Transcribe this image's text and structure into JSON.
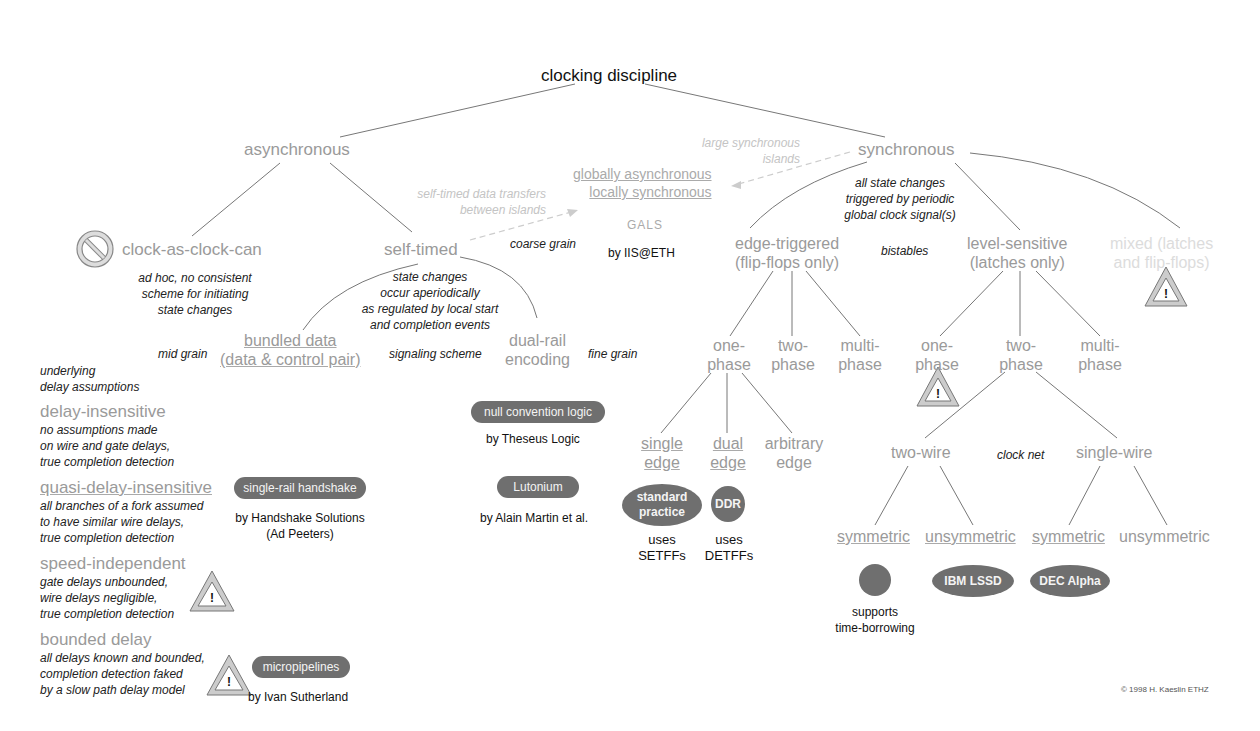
{
  "title": "clocking discipline",
  "copyright": "© 1998 H. Kaeslin ETHZ",
  "level1": {
    "asynchronous": "asynchronous",
    "synchronous": "synchronous"
  },
  "async": {
    "clock_as_clock_can": "clock-as-clock-can",
    "clock_as_clock_can_note": [
      "ad hoc, no consistent",
      "scheme for initiating",
      "state changes"
    ],
    "self_timed": "self-timed",
    "self_timed_note": [
      "state changes",
      "occur aperiodically",
      "as regulated by local start",
      "and completion events"
    ],
    "bundled_data": [
      "bundled data",
      "(data & control pair)"
    ],
    "dual_rail": [
      "dual-rail",
      "encoding"
    ],
    "mid_grain": "mid grain",
    "signaling_scheme": "signaling scheme",
    "fine_grain": "fine grain",
    "coarse_grain": "coarse grain",
    "self_timed_transfers": [
      "self-timed data transfers",
      "between islands"
    ]
  },
  "gals": {
    "line1": "globally asynchronous",
    "line2": "locally synchronous",
    "abbr": "GALS",
    "by": "by IIS@ETH",
    "large_islands": [
      "large synchronous",
      "islands"
    ]
  },
  "delay_models": {
    "header": [
      "underlying",
      "delay assumptions"
    ],
    "items": [
      {
        "name": "delay-insensitive",
        "desc": [
          "no assumptions made",
          "on wire and gate delays,",
          "true completion detection"
        ]
      },
      {
        "name": "quasi-delay-insensitive",
        "desc": [
          "all branches of a fork assumed",
          "to have similar wire delays,",
          "true completion detection"
        ]
      },
      {
        "name": "speed-independent",
        "desc": [
          "gate delays unbounded,",
          "wire delays negligible,",
          "true completion detection"
        ]
      },
      {
        "name": "bounded delay",
        "desc": [
          "all delays known and bounded,",
          "completion detection faked",
          "by a slow path delay model"
        ]
      }
    ]
  },
  "examples": {
    "ncl": {
      "label": "null convention logic",
      "by": "by Theseus Logic"
    },
    "lutonium": {
      "label": "Lutonium",
      "by": "by Alain Martin et al."
    },
    "handshake": {
      "label": "single-rail handshake",
      "by": [
        "by Handshake Solutions",
        "(Ad Peeters)"
      ]
    },
    "micropipelines": {
      "label": "micropipelines",
      "by": "by Ivan Sutherland"
    }
  },
  "sync": {
    "note": [
      "all state changes",
      "triggered by periodic",
      "global clock signal(s)"
    ],
    "bistables": "bistables",
    "edge_triggered": [
      "edge-triggered",
      "(flip-flops only)"
    ],
    "level_sensitive": [
      "level-sensitive",
      "(latches only)"
    ],
    "mixed": [
      "mixed (latches",
      "and flip-flops)"
    ],
    "edge_phases": [
      [
        "one-",
        "phase"
      ],
      [
        "two-",
        "phase"
      ],
      [
        "multi-",
        "phase"
      ]
    ],
    "level_phases": [
      [
        "one-",
        "phase"
      ],
      [
        "two-",
        "phase"
      ],
      [
        "multi-",
        "phase"
      ]
    ],
    "edges": [
      [
        "single",
        "edge"
      ],
      [
        "dual",
        "edge"
      ],
      [
        "arbitrary",
        "edge"
      ]
    ],
    "standard_practice": [
      "standard",
      "practice"
    ],
    "ddr": "DDR",
    "uses_setffs": [
      "uses",
      "SETFFs"
    ],
    "uses_detffs": [
      "uses",
      "DETFFs"
    ],
    "clock_net": "clock net",
    "two_wire": "two-wire",
    "single_wire": "single-wire",
    "leaves": [
      "symmetric",
      "unsymmetric",
      "symmetric",
      "unsymmetric"
    ],
    "ibm": "IBM LSSD",
    "dec": "DEC Alpha",
    "time_borrowing": [
      "supports",
      "time-borrowing"
    ]
  }
}
